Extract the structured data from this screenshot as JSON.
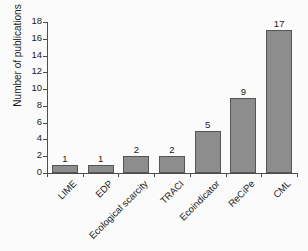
{
  "chart_data": {
    "type": "bar",
    "title": "",
    "xlabel": "",
    "ylabel": "Number of publications",
    "categories": [
      "LIME",
      "EDP",
      "Ecological scarcity",
      "TRACI",
      "Ecoindicator",
      "ReCiPe",
      "CML"
    ],
    "values": [
      1,
      1,
      2,
      2,
      5,
      9,
      17
    ],
    "value_labels": [
      "1",
      "1",
      "2",
      "2",
      "5",
      "9",
      "17"
    ],
    "ylim": [
      0,
      18
    ],
    "yticks": [
      0,
      2,
      4,
      6,
      8,
      10,
      12,
      14,
      16,
      18
    ],
    "ytick_labels": [
      "0",
      "2",
      "4",
      "6",
      "8",
      "10",
      "12",
      "14",
      "16",
      "18"
    ],
    "grid": false,
    "legend": null,
    "bar_color": "#8d8d8d",
    "bar_edge_color": "#555555",
    "axis_color": "#4d4d4d",
    "text_color": "#1c1c1c",
    "background": "#fbfbfb",
    "xtick_label_rotation": -45
  }
}
